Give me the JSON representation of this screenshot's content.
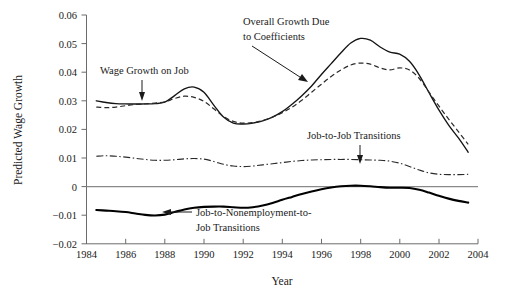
{
  "chart_data": {
    "type": "line",
    "title": "",
    "xlabel": "Year",
    "ylabel": "Predicted Wage Growth",
    "xlim": [
      1984,
      2004
    ],
    "ylim": [
      -0.02,
      0.06
    ],
    "grid": false,
    "legend_position": "inline-annotations",
    "xticks": [
      1984,
      1986,
      1988,
      1990,
      1992,
      1994,
      1996,
      1998,
      2000,
      2002,
      2004
    ],
    "xtick_labels": [
      "1984",
      "1986",
      "1988",
      "1990",
      "1992",
      "1994",
      "1996",
      "1998",
      "2000",
      "2002",
      "2004"
    ],
    "yticks": [
      -0.02,
      -0.01,
      0,
      0.01,
      0.02,
      0.03,
      0.04,
      0.05,
      0.06
    ],
    "ytick_labels": [
      "−0.02",
      "−0.01",
      "0",
      "0.01",
      "0.02",
      "0.03",
      "0.04",
      "0.05",
      "0.06"
    ],
    "x": [
      1984.5,
      1985,
      1985.5,
      1986,
      1986.5,
      1987,
      1987.5,
      1988,
      1988.5,
      1989,
      1989.5,
      1990,
      1990.5,
      1991,
      1991.5,
      1992,
      1992.5,
      1993,
      1993.5,
      1994,
      1994.5,
      1995,
      1995.5,
      1996,
      1996.5,
      1997,
      1997.5,
      1998,
      1998.5,
      1999,
      1999.5,
      2000,
      2000.5,
      2001,
      2001.5,
      2002,
      2002.5,
      2003,
      2003.5
    ],
    "series": [
      {
        "name": "Overall Growth Due to Coefficients",
        "style": "solid-thin",
        "values": [
          0.03,
          0.0294,
          0.029,
          0.0289,
          0.0289,
          0.0289,
          0.029,
          0.0295,
          0.0318,
          0.0342,
          0.0348,
          0.033,
          0.0285,
          0.0243,
          0.0222,
          0.0219,
          0.0222,
          0.023,
          0.0243,
          0.0262,
          0.0288,
          0.0318,
          0.0352,
          0.0392,
          0.043,
          0.0468,
          0.0502,
          0.0518,
          0.0512,
          0.0488,
          0.047,
          0.0463,
          0.0438,
          0.039,
          0.0328,
          0.0268,
          0.0215,
          0.017,
          0.012
        ]
      },
      {
        "name": "Wage Growth on Job",
        "style": "dashed",
        "values": [
          0.0278,
          0.0276,
          0.0278,
          0.0283,
          0.0287,
          0.0289,
          0.0292,
          0.0296,
          0.0308,
          0.0316,
          0.0312,
          0.0298,
          0.0272,
          0.0245,
          0.0228,
          0.0222,
          0.0224,
          0.0231,
          0.0243,
          0.0258,
          0.0278,
          0.0302,
          0.033,
          0.0358,
          0.0385,
          0.0408,
          0.0425,
          0.0432,
          0.0428,
          0.0415,
          0.0408,
          0.0415,
          0.0408,
          0.0378,
          0.033,
          0.0282,
          0.0236,
          0.0192,
          0.0148
        ]
      },
      {
        "name": "Job-to-Job Transitions",
        "style": "dash-dot",
        "values": [
          0.0106,
          0.0108,
          0.0106,
          0.0103,
          0.0099,
          0.0095,
          0.0092,
          0.0092,
          0.0094,
          0.0097,
          0.0098,
          0.0096,
          0.0088,
          0.0078,
          0.0072,
          0.007,
          0.0072,
          0.0076,
          0.008,
          0.0084,
          0.0088,
          0.0091,
          0.0093,
          0.0094,
          0.0095,
          0.0095,
          0.0095,
          0.0094,
          0.0093,
          0.0092,
          0.0089,
          0.0082,
          0.007,
          0.0058,
          0.0048,
          0.0043,
          0.0042,
          0.0042,
          0.0043
        ]
      },
      {
        "name": "Job-to-Nonemployment-to-Job Transitions",
        "style": "solid-thick",
        "values": [
          -0.0082,
          -0.0084,
          -0.0086,
          -0.0089,
          -0.0094,
          -0.0099,
          -0.0101,
          -0.0098,
          -0.0089,
          -0.008,
          -0.0074,
          -0.0071,
          -0.007,
          -0.007,
          -0.0072,
          -0.0074,
          -0.0072,
          -0.0066,
          -0.0057,
          -0.0046,
          -0.0036,
          -0.0026,
          -0.0017,
          -0.0009,
          -0.0003,
          0.0001,
          0.0003,
          0.0003,
          0.0001,
          -0.0002,
          -0.0004,
          -0.0004,
          -0.0005,
          -0.0011,
          -0.0021,
          -0.0032,
          -0.0042,
          -0.005,
          -0.0056
        ]
      }
    ],
    "annotations": [
      {
        "id": "wage-growth-on-job",
        "text": "Wage Growth on Job",
        "lines": [
          "Wage Growth on Job"
        ]
      },
      {
        "id": "overall-growth",
        "text": "Overall Growth Due to Coefficients",
        "lines": [
          "Overall Growth Due",
          "to Coefficients"
        ]
      },
      {
        "id": "job-to-job",
        "text": "Job-to-Job Transitions",
        "lines": [
          "Job-to-Job Transitions"
        ]
      },
      {
        "id": "job-to-nonemployment",
        "text": "Job-to-Nonemployment-to-Job Transitions",
        "lines": [
          "Job-to-Nonemployment-to-",
          "Job Transitions"
        ]
      }
    ]
  },
  "colors": {
    "background": "#ffffff",
    "axis": "#6b6b6b",
    "zero_line": "#8a8a8a",
    "ink": "#1a1a1a"
  }
}
